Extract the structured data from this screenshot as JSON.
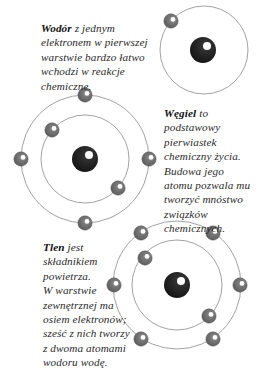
{
  "diagram": {
    "colors": {
      "orbit": "#8a8a8a",
      "nucleus": "#1a1a1a",
      "electron": "#6e6e6e",
      "highlight": "#ffffff",
      "text": "#2a2a2a"
    },
    "atoms": [
      {
        "name": "Wodór",
        "nucleus": {
          "x": 203,
          "y": 50,
          "r": 13
        },
        "orbits": [
          44
        ],
        "center": {
          "x": 204,
          "y": 50
        },
        "electrons": [
          {
            "x": 171,
            "y": 21
          }
        ]
      },
      {
        "name": "Węgiel",
        "nucleus": {
          "x": 85,
          "y": 159,
          "r": 13
        },
        "orbits": [
          64,
          44
        ],
        "center": {
          "x": 85,
          "y": 159
        },
        "electrons": [
          {
            "x": 85,
            "y": 95
          },
          {
            "x": 21,
            "y": 159
          },
          {
            "x": 149,
            "y": 159
          },
          {
            "x": 85,
            "y": 223
          },
          {
            "x": 52,
            "y": 130
          },
          {
            "x": 118,
            "y": 188
          }
        ]
      },
      {
        "name": "Tlen",
        "nucleus": {
          "x": 177,
          "y": 285,
          "r": 13
        },
        "orbits": [
          64,
          45
        ],
        "center": {
          "x": 177,
          "y": 285
        },
        "electrons": [
          {
            "x": 141,
            "y": 233
          },
          {
            "x": 213,
            "y": 233
          },
          {
            "x": 114,
            "y": 285
          },
          {
            "x": 240,
            "y": 285
          },
          {
            "x": 141,
            "y": 339
          },
          {
            "x": 213,
            "y": 339
          },
          {
            "x": 145,
            "y": 258
          },
          {
            "x": 209,
            "y": 316
          }
        ]
      }
    ]
  },
  "captions": {
    "hydrogen": {
      "term": "Wodór",
      "lines": [
        " z jednym",
        "elektronem w pierwszej",
        "warstwie bardzo łatwo",
        "wchodzi w reakcje",
        "chemiczne."
      ]
    },
    "carbon": {
      "term": "Węgiel",
      "lines": [
        " to",
        "podstawowy",
        "pierwiastek",
        "chemiczny życia.",
        "Budowa jego",
        "atomu pozwala mu",
        "tworzyć mnóstwo",
        "związków",
        "chemicznych."
      ]
    },
    "oxygen": {
      "term": "Tlen",
      "lines": [
        " jest",
        "składnikiem",
        "powietrza.",
        "W warstwie",
        "zewnętrznej ma",
        "osiem elektronów;",
        "sześć z nich tworzy",
        "z dwoma atomami",
        "wodoru wodę."
      ]
    }
  }
}
